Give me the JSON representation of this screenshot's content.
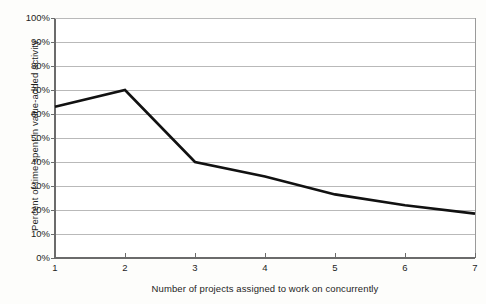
{
  "chart_data": {
    "type": "line",
    "title": "",
    "subtitle": "",
    "xlabel": "Number of projects assigned to work on concurrently",
    "ylabel": "Percent of time spent in value-added activity",
    "x": [
      1,
      2,
      3,
      4,
      5,
      6,
      7
    ],
    "values": [
      63,
      70,
      40,
      34,
      26.5,
      22,
      18.5
    ],
    "series": [
      {
        "name": "Percent of time spent in value-added activity",
        "values": [
          63,
          70,
          40,
          34,
          26.5,
          22,
          18.5
        ]
      }
    ],
    "xlim": [
      1,
      7
    ],
    "ylim": [
      0,
      100
    ],
    "ytick_labels": [
      "0%",
      "10%",
      "20%",
      "30%",
      "40%",
      "50%",
      "60%",
      "70%",
      "80%",
      "90%",
      "100%"
    ],
    "ytick_values": [
      0,
      10,
      20,
      30,
      40,
      50,
      60,
      70,
      80,
      90,
      100
    ],
    "xtick_labels": [
      "1",
      "2",
      "3",
      "4",
      "5",
      "6",
      "7"
    ],
    "xtick_values": [
      1,
      2,
      3,
      4,
      5,
      6,
      7
    ],
    "grid": true,
    "grid_axis": "y",
    "legend": false,
    "legend_position": "none",
    "colors": {
      "line": "#111111",
      "grid": "#b9b9b9",
      "axis": "#777777",
      "plot_background": "#ffffff",
      "page_background": "#fdfdfb",
      "text": "#1d1d1d"
    },
    "line_width": 2.6,
    "markers": false
  },
  "figure": {
    "plot_left": 55,
    "plot_right": 475,
    "plot_top": 18,
    "plot_bottom": 258
  }
}
